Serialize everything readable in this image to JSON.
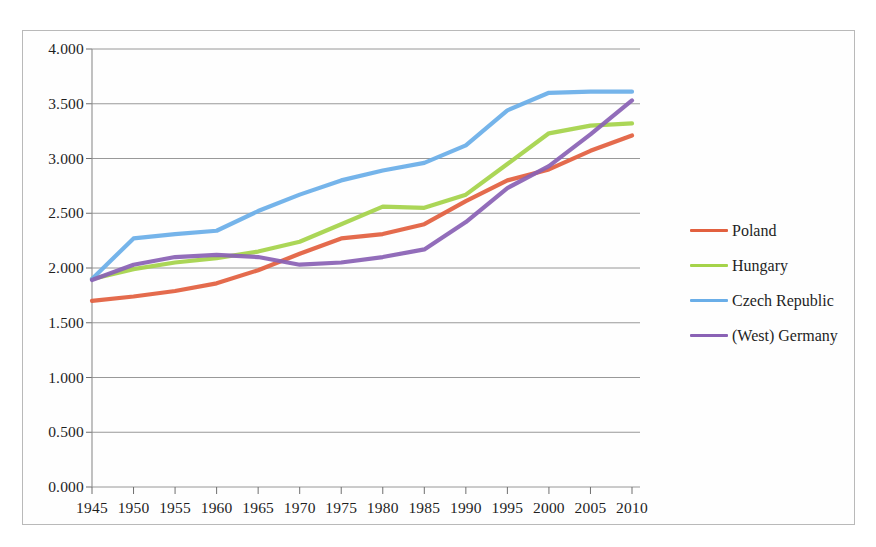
{
  "chart_data": {
    "type": "line",
    "title": "",
    "subtitle": "",
    "xlabel": "",
    "ylabel": "",
    "x": [
      1945,
      1950,
      1955,
      1960,
      1965,
      1970,
      1975,
      1980,
      1985,
      1990,
      1995,
      2000,
      2005,
      2010
    ],
    "categories": [
      "1945",
      "1950",
      "1955",
      "1960",
      "1965",
      "1970",
      "1975",
      "1980",
      "1985",
      "1990",
      "1995",
      "2000",
      "2005",
      "2010"
    ],
    "xlim": [
      1945,
      2010
    ],
    "ylim": [
      0.0,
      4.0
    ],
    "ytick_labels": [
      "0.000",
      "0.500",
      "1.000",
      "1.500",
      "2.000",
      "2.500",
      "3.000",
      "3.500",
      "4.000"
    ],
    "ytick_values": [
      0.0,
      0.5,
      1.0,
      1.5,
      2.0,
      2.5,
      3.0,
      3.5,
      4.0
    ],
    "grid": true,
    "grid_axis": "y",
    "legend_position": "right",
    "series": [
      {
        "name": "Poland",
        "color": "#e2603f",
        "values": [
          1.7,
          1.74,
          1.79,
          1.86,
          1.98,
          2.13,
          2.27,
          2.31,
          2.4,
          2.61,
          2.8,
          2.9,
          3.07,
          3.21
        ]
      },
      {
        "name": "Hungary",
        "color": "#a5d34a",
        "values": [
          1.9,
          1.99,
          2.05,
          2.09,
          2.15,
          2.24,
          2.4,
          2.56,
          2.55,
          2.67,
          2.95,
          3.23,
          3.3,
          3.32
        ]
      },
      {
        "name": "Czech Republic",
        "color": "#6aaee8",
        "values": [
          1.9,
          2.27,
          2.31,
          2.34,
          2.52,
          2.67,
          2.8,
          2.89,
          2.96,
          3.12,
          3.44,
          3.6,
          3.61,
          3.61
        ]
      },
      {
        "name": "(West) Germany",
        "color": "#8a62b5",
        "values": [
          1.89,
          2.03,
          2.1,
          2.12,
          2.1,
          2.03,
          2.05,
          2.1,
          2.17,
          2.42,
          2.73,
          2.93,
          3.22,
          3.53
        ]
      }
    ]
  },
  "legend": {
    "entries": [
      {
        "label": "Poland",
        "color": "#e2603f"
      },
      {
        "label": "Hungary",
        "color": "#a5d34a"
      },
      {
        "label": "Czech Republic",
        "color": "#6aaee8"
      },
      {
        "label": "(West) Germany",
        "color": "#8a62b5"
      }
    ]
  }
}
